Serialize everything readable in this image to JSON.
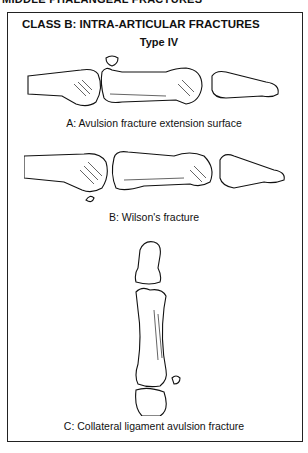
{
  "page": {
    "running_header": "MIDDLE PHALANGEAL FRACTURES",
    "figure": {
      "title": "CLASS B: INTRA-ARTICULAR FRACTURES",
      "subtitle": "Type IV",
      "panels": [
        {
          "id": "A",
          "caption": "A: Avulsion fracture extension surface",
          "illustration": "lateral view of finger phalanges with dorsal avulsion fragment at base of middle phalanx"
        },
        {
          "id": "B",
          "caption": "B: Wilson's fracture",
          "illustration": "lateral view of finger phalanges with volar plate avulsion fragment"
        },
        {
          "id": "C",
          "caption": "C: Collateral ligament avulsion fracture",
          "illustration": "dorsal view of finger phalanges with lateral avulsion fragment at middle phalanx base"
        }
      ]
    }
  }
}
